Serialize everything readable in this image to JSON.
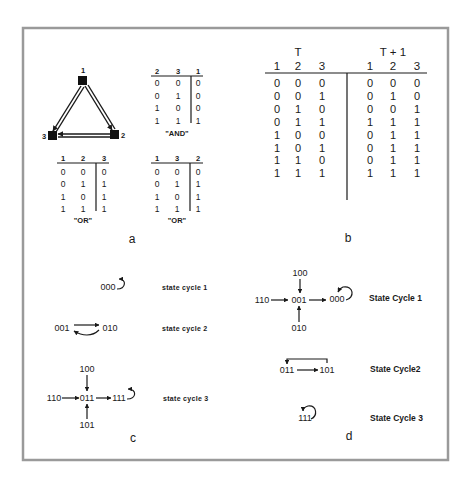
{
  "figure": {
    "panels": {
      "a": {
        "label": "a",
        "network": {
          "nodes": [
            {
              "id": "1",
              "label": "1"
            },
            {
              "id": "2",
              "label": "2"
            },
            {
              "id": "3",
              "label": "3"
            }
          ],
          "edges": [
            {
              "from": "1",
              "to": "3"
            },
            {
              "from": "3",
              "to": "1"
            },
            {
              "from": "1",
              "to": "2"
            },
            {
              "from": "2",
              "to": "1"
            },
            {
              "from": "2",
              "to": "3"
            },
            {
              "from": "3",
              "to": "2"
            }
          ]
        },
        "tables": [
          {
            "name": "AND",
            "caption": "\"AND\"",
            "headers": [
              "2",
              "3",
              "1"
            ],
            "rows": [
              [
                "0",
                "0",
                "0"
              ],
              [
                "0",
                "1",
                "0"
              ],
              [
                "1",
                "0",
                "0"
              ],
              [
                "1",
                "1",
                "1"
              ]
            ]
          },
          {
            "name": "OR-node3",
            "caption": "\"OR\"",
            "headers": [
              "1",
              "2",
              "3"
            ],
            "rows": [
              [
                "0",
                "0",
                "0"
              ],
              [
                "0",
                "1",
                "1"
              ],
              [
                "1",
                "0",
                "1"
              ],
              [
                "1",
                "1",
                "1"
              ]
            ]
          },
          {
            "name": "OR-node2",
            "caption": "\"OR\"",
            "headers": [
              "1",
              "3",
              "2"
            ],
            "rows": [
              [
                "0",
                "0",
                "0"
              ],
              [
                "0",
                "1",
                "1"
              ],
              [
                "1",
                "0",
                "1"
              ],
              [
                "1",
                "1",
                "1"
              ]
            ]
          }
        ]
      },
      "b": {
        "label": "b",
        "group_t": "T",
        "group_t1": "T + 1",
        "headers_t": [
          "1",
          "2",
          "3"
        ],
        "headers_t1": [
          "1",
          "2",
          "3"
        ],
        "rows_t": [
          [
            "0",
            "0",
            "0"
          ],
          [
            "0",
            "0",
            "1"
          ],
          [
            "0",
            "1",
            "0"
          ],
          [
            "0",
            "1",
            "1"
          ],
          [
            "1",
            "0",
            "0"
          ],
          [
            "1",
            "0",
            "1"
          ],
          [
            "1",
            "1",
            "0"
          ],
          [
            "1",
            "1",
            "1"
          ]
        ],
        "rows_t1": [
          [
            "0",
            "0",
            "0"
          ],
          [
            "0",
            "1",
            "0"
          ],
          [
            "0",
            "0",
            "1"
          ],
          [
            "1",
            "1",
            "1"
          ],
          [
            "0",
            "1",
            "1"
          ],
          [
            "0",
            "1",
            "1"
          ],
          [
            "0",
            "1",
            "1"
          ],
          [
            "1",
            "1",
            "1"
          ]
        ]
      },
      "c": {
        "label": "c",
        "cycles": [
          {
            "label": "state cycle 1",
            "states": [
              "000"
            ]
          },
          {
            "label": "state cycle 2",
            "states": [
              "001",
              "010"
            ]
          },
          {
            "label": "state cycle 3",
            "states": [
              "100",
              "110",
              "011",
              "111",
              "101"
            ]
          }
        ]
      },
      "d": {
        "label": "d",
        "cycles": [
          {
            "label": "State Cycle 1",
            "states": [
              "100",
              "110",
              "001",
              "000",
              "010"
            ]
          },
          {
            "label": "State Cycle2",
            "states": [
              "011",
              "101"
            ]
          },
          {
            "label": "State Cycle 3",
            "states": [
              "111"
            ]
          }
        ]
      }
    }
  }
}
